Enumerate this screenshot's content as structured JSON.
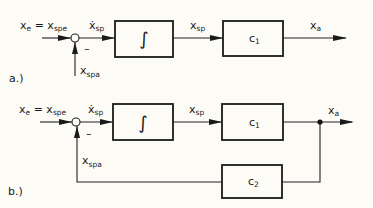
{
  "diagram_a": {
    "tag": "a.)",
    "input_label": {
      "main": "x",
      "sub": "e",
      "eq": " = x",
      "eq_sub": "spe"
    },
    "sum_output_label": {
      "main": "ẋ",
      "sub": "sp"
    },
    "minus_sign": "–",
    "feedback_label": {
      "main": "x",
      "sub": "spa"
    },
    "integrator_symbol": "∫",
    "mid_label": {
      "main": "x",
      "sub": "sp"
    },
    "gain_block": {
      "main": "c",
      "sub": "1"
    },
    "output_label": {
      "main": "x",
      "sub": "a"
    }
  },
  "diagram_b": {
    "tag": "b.)",
    "input_label": {
      "main": "x",
      "sub": "e",
      "eq": " = x",
      "eq_sub": "spe"
    },
    "sum_output_label": {
      "main": "ẋ",
      "sub": "sp"
    },
    "minus_sign": "–",
    "feedback_label": {
      "main": "x",
      "sub": "spa"
    },
    "integrator_symbol": "∫",
    "mid_label": {
      "main": "x",
      "sub": "sp"
    },
    "gain_block": {
      "main": "c",
      "sub": "1"
    },
    "feedback_block": {
      "main": "c",
      "sub": "2"
    },
    "output_label": {
      "main": "x",
      "sub": "a"
    }
  }
}
